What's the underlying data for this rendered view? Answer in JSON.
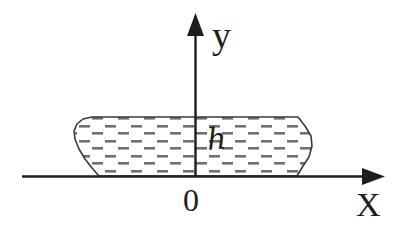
{
  "figure": {
    "background_color": "#ffffff",
    "stroke_color": "#1d1d1d",
    "hatch_color": "#6e6e6e",
    "width": 399,
    "height": 233
  },
  "axes": {
    "x_axis": {
      "label": "X",
      "y_position": 176,
      "x_start": 22,
      "x_end": 383,
      "arrow": "arrow-right"
    },
    "y_axis": {
      "label": "y",
      "x_position": 195,
      "y_start": 176,
      "y_end": 14,
      "arrow": "arrow-up"
    },
    "origin_label": "0"
  },
  "shape": {
    "name": "hatched-slab",
    "height_label": "h",
    "top_y": 116,
    "base_y": 176,
    "left_x": 67,
    "right_x": 312,
    "fill_pattern": "horizontal-dashes",
    "outline": "M 99 176 L 92 168 L 85 159 L 79 149 L 75 139 L 74 131 L 77 124 L 83 119 L 92 117 L 298 117 L 305 126 L 311 136 L 312 146 L 309 157 L 303 166 L 297 176 Z"
  },
  "ticks": {
    "x_ticks": [],
    "y_ticks": []
  }
}
